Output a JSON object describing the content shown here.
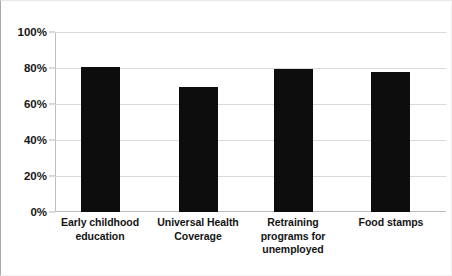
{
  "chart_data": {
    "type": "bar",
    "title": "",
    "subtitle": "",
    "xlabel": "",
    "ylabel": "",
    "categories": [
      "Early childhood education",
      "Universal Health Coverage",
      "Retraining programs for unemployed",
      "Food stamps"
    ],
    "category_lines": [
      [
        "Early childhood",
        "education"
      ],
      [
        "Universal Health",
        "Coverage"
      ],
      [
        "Retraining",
        "programs for",
        "unemployed"
      ],
      [
        "Food stamps"
      ]
    ],
    "values": [
      81,
      70,
      80,
      78
    ],
    "value_labels": [
      "81%",
      "70%",
      "80%",
      "78%"
    ],
    "ylim": [
      0,
      100
    ],
    "ytick_values": [
      0,
      20,
      40,
      60,
      80,
      100
    ],
    "ytick_labels": [
      "0%",
      "20%",
      "40%",
      "60%",
      "80%",
      "100%"
    ],
    "grid": true,
    "legend": false,
    "legend_position": "none",
    "series": [
      {
        "name": "Support",
        "values": [
          81,
          70,
          80,
          78
        ]
      }
    ],
    "colors": {
      "bar": "#0d0d0d",
      "gridline": "#d9d9d9",
      "axis": "#bdbdbd",
      "text": "#161616",
      "background": "#ffffff"
    }
  }
}
